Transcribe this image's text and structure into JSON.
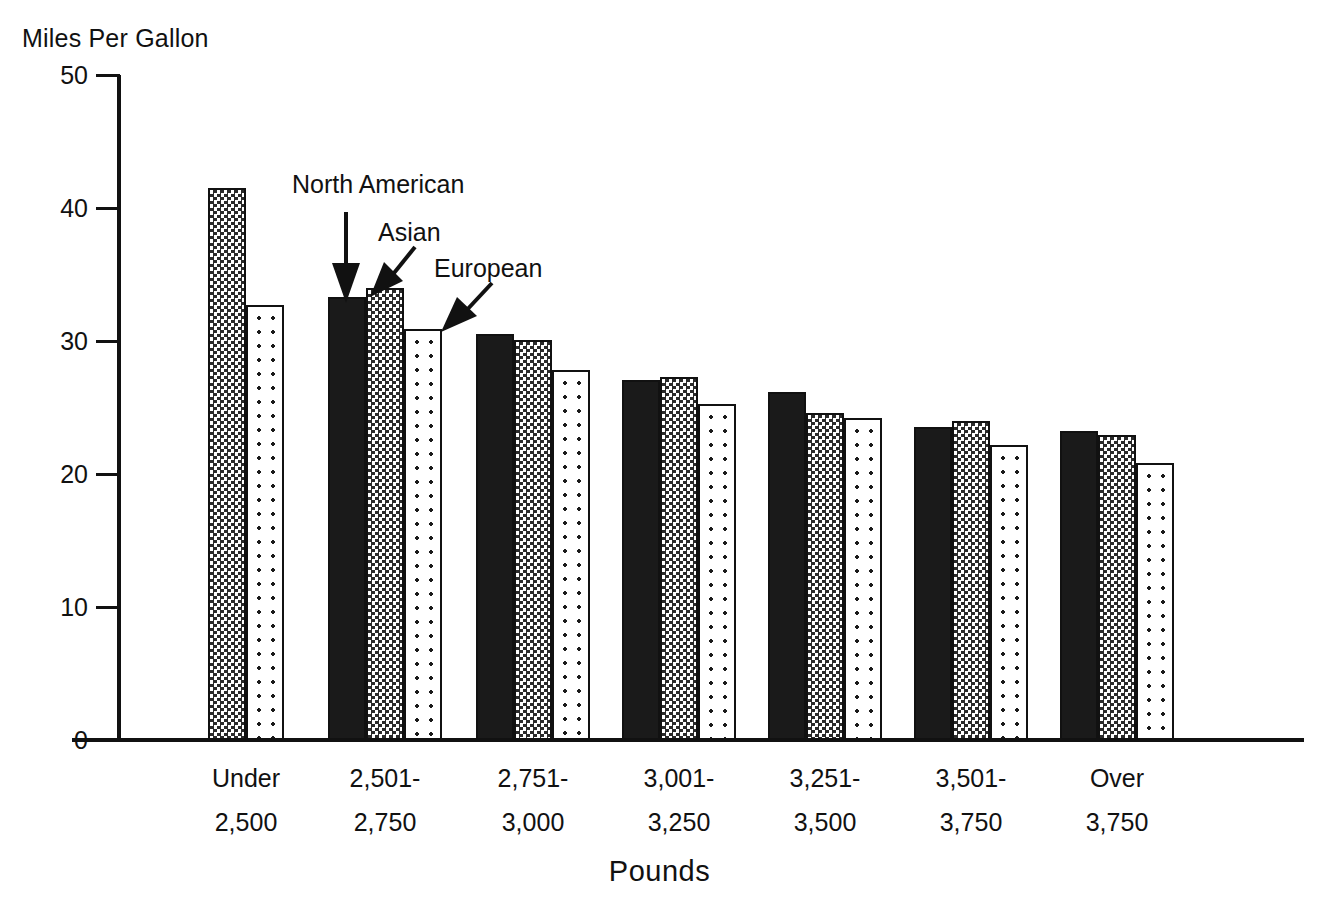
{
  "chart_data": {
    "type": "bar",
    "title": "",
    "ylabel": "Miles Per Gallon",
    "xlabel": "Pounds",
    "ylim": [
      0,
      50
    ],
    "yticks": [
      0,
      10,
      20,
      30,
      40,
      50
    ],
    "ytick_labels": [
      "0",
      "10",
      "20",
      "30",
      "40",
      "50"
    ],
    "grid": false,
    "legend": "arrow-annotations",
    "categories": [
      "Under 2,500",
      "2,501-2,750",
      "2,751-3,000",
      "3,001-3,250",
      "3,251-3,500",
      "3,501-3,750",
      "Over 3,750"
    ],
    "category_lines": [
      [
        "Under",
        "2,500"
      ],
      [
        "2,501-",
        "2,750"
      ],
      [
        "2,751-",
        "3,000"
      ],
      [
        "3,001-",
        "3,250"
      ],
      [
        "3,251-",
        "3,500"
      ],
      [
        "3,501-",
        "3,750"
      ],
      [
        "Over",
        "3,750"
      ]
    ],
    "series": [
      {
        "name": "North American",
        "fill": "solid-black",
        "color": "#1a1a1a",
        "values": [
          null,
          33.3,
          30.5,
          27.1,
          26.2,
          23.5,
          23.2
        ]
      },
      {
        "name": "Asian",
        "fill": "dense-checker",
        "color": "#808080",
        "values": [
          41.5,
          34.0,
          30.1,
          27.3,
          24.6,
          24.0,
          22.9
        ]
      },
      {
        "name": "European",
        "fill": "sparse-dots",
        "color": "#e6e6e6",
        "values": [
          32.7,
          30.9,
          27.8,
          25.3,
          24.2,
          22.2,
          20.8
        ]
      }
    ],
    "annotations": [
      {
        "text": "North American",
        "points_to": "North American bar in 2,501-2,750 group"
      },
      {
        "text": "Asian",
        "points_to": "Asian bar in 2,501-2,750 group"
      },
      {
        "text": "European",
        "points_to": "European bar in 2,501-2,750 group"
      }
    ]
  }
}
